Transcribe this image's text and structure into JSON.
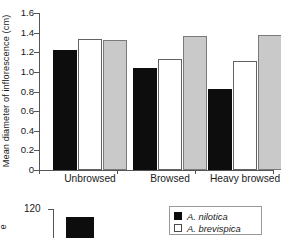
{
  "chart_data": [
    {
      "type": "bar",
      "title": "",
      "xlabel": "",
      "ylabel": "Mean diameter of inflorescence (cm)",
      "ylim": [
        0,
        1.6
      ],
      "yticks": [
        "1.6",
        "1.4",
        "1.2",
        "1.0",
        "0.8",
        "0.6",
        "0.4",
        "0.2",
        "0"
      ],
      "ytick_values": [
        1.6,
        1.4,
        1.2,
        1.0,
        0.8,
        0.6,
        0.4,
        0.2,
        0
      ],
      "grid": false,
      "legend_position": "bottom-right",
      "categories": [
        "Unbrowsed",
        "Browsed",
        "Heavy browsed"
      ],
      "series": [
        {
          "name": "A. nilotica",
          "color": "#0d0d0d",
          "values": [
            1.22,
            1.04,
            0.83
          ]
        },
        {
          "name": "A. brevispica",
          "color": "#ffffff",
          "values": [
            1.34,
            1.13,
            1.11
          ]
        },
        {
          "name": "series-3",
          "color": "#c9c9c9",
          "values": [
            1.32,
            1.37,
            1.38
          ]
        }
      ]
    },
    {
      "type": "bar",
      "note": "clipped partial chart at bottom of image",
      "ylabel": "e",
      "yticks": [
        "120"
      ],
      "ytick_values": [
        120
      ],
      "categories": [],
      "series": [
        {
          "name": "A. nilotica",
          "color": "#0d0d0d",
          "values": []
        }
      ]
    }
  ],
  "main_chart": {
    "ylabel": "Mean diameter of inflorescence (cm)",
    "yticks": [
      {
        "label": "1.6",
        "value": 1.6
      },
      {
        "label": "1.4",
        "value": 1.4
      },
      {
        "label": "1.2",
        "value": 1.2
      },
      {
        "label": "1.0",
        "value": 1.0
      },
      {
        "label": "0.8",
        "value": 0.8
      },
      {
        "label": "0.6",
        "value": 0.6
      },
      {
        "label": "0.4",
        "value": 0.4
      },
      {
        "label": "0.2",
        "value": 0.2
      },
      {
        "label": "0",
        "value": 0
      }
    ],
    "groups": [
      {
        "label": "Unbrowsed",
        "bars": [
          {
            "style": "black",
            "value": 1.22
          },
          {
            "style": "white",
            "value": 1.34
          },
          {
            "style": "gray",
            "value": 1.32
          }
        ]
      },
      {
        "label": "Browsed",
        "bars": [
          {
            "style": "black",
            "value": 1.04
          },
          {
            "style": "white",
            "value": 1.13
          },
          {
            "style": "gray",
            "value": 1.37
          }
        ]
      },
      {
        "label": "Heavy browsed",
        "bars": [
          {
            "style": "black",
            "value": 0.83
          },
          {
            "style": "white",
            "value": 1.11
          },
          {
            "style": "gray",
            "value": 1.38
          }
        ]
      }
    ]
  },
  "sub_chart": {
    "ylabel": "e",
    "ytick_label": "120"
  },
  "legend": {
    "items": [
      {
        "label": "A. nilotica",
        "swatch": "black"
      },
      {
        "label": "A. brevispica",
        "swatch": "white"
      }
    ]
  }
}
